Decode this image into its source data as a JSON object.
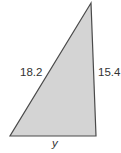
{
  "diagram": {
    "type": "right-triangle",
    "fill_color": "#d4d4d4",
    "stroke_color": "#4a4a4a",
    "vertices": {
      "apex": [
        91,
        3
      ],
      "bottom_left": [
        10,
        136
      ],
      "bottom_right": [
        96,
        136
      ]
    },
    "labels": {
      "hypotenuse": "18.2",
      "right_side": "15.4",
      "base": "y"
    }
  }
}
